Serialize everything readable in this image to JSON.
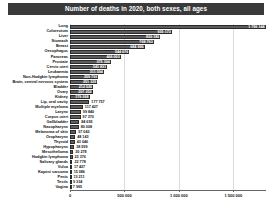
{
  "chart_data": {
    "type": "bar",
    "orientation": "horizontal",
    "title": "Number of deaths in 2020, both sexes, all ages",
    "xlabel": "",
    "ylabel": "",
    "xlim": [
      0,
      1800000
    ],
    "grid": true,
    "legend": null,
    "tick_labels": [
      "0",
      "500 000",
      "1 000 000",
      "1 500 000"
    ],
    "tick_values": [
      0,
      500000,
      1000000,
      1500000
    ],
    "categories": [
      "Lung",
      "Colorectum",
      "Liver",
      "Stomach",
      "Breast",
      "Oesophagus",
      "Pancreas",
      "Prostate",
      "Cervix uteri",
      "Leukaemia",
      "Non-Hodgkin lymphoma",
      "Brain, central nervous system",
      "Bladder",
      "Ovary",
      "Kidney",
      "Lip, oral cavity",
      "Multiple myeloma",
      "Larynx",
      "Corpus uteri",
      "Gallbladder",
      "Nasopharynx",
      "Melanoma of skin",
      "Oropharynx",
      "Thyroid",
      "Hypopharynx",
      "Mesothelioma",
      "Hodgkin lymphoma",
      "Salivary glands",
      "Vulva",
      "Kaposi sarcoma",
      "Penis",
      "Testis",
      "Vagina"
    ],
    "values": [
      1796144,
      935173,
      830180,
      768793,
      684996,
      544076,
      466003,
      375304,
      341831,
      311594,
      259793,
      251329,
      212536,
      207252,
      179368,
      177757,
      117427,
      99840,
      97370,
      84695,
      80008,
      57043,
      48143,
      43646,
      38599,
      30278,
      23376,
      22778,
      17427,
      15086,
      13211,
      9334,
      7995
    ],
    "value_labels": [
      "1 796 144",
      "935 173",
      "830 180",
      "768 793",
      "684 996",
      "544 076",
      "466 003",
      "375 304",
      "341 831",
      "311 594",
      "259 793",
      "251 329",
      "212 536",
      "207 252",
      "179 368",
      "177 757",
      "117 427",
      "99 840",
      "97 370",
      "84 695",
      "80 008",
      "57 043",
      "48 143",
      "43 646",
      "38 599",
      "30 278",
      "23 376",
      "22 778",
      "17 427",
      "15 086",
      "13 211",
      "9 334",
      "7 995"
    ],
    "colors": {
      "bar_fill": "#5d5d5d",
      "bar_edge": "#2b2b2b",
      "title_bg": "#3a3a3a",
      "title_text": "#ffffff",
      "label_text": "#111111",
      "value_text_inside": "#ffffff",
      "background": "#ffffff"
    }
  }
}
